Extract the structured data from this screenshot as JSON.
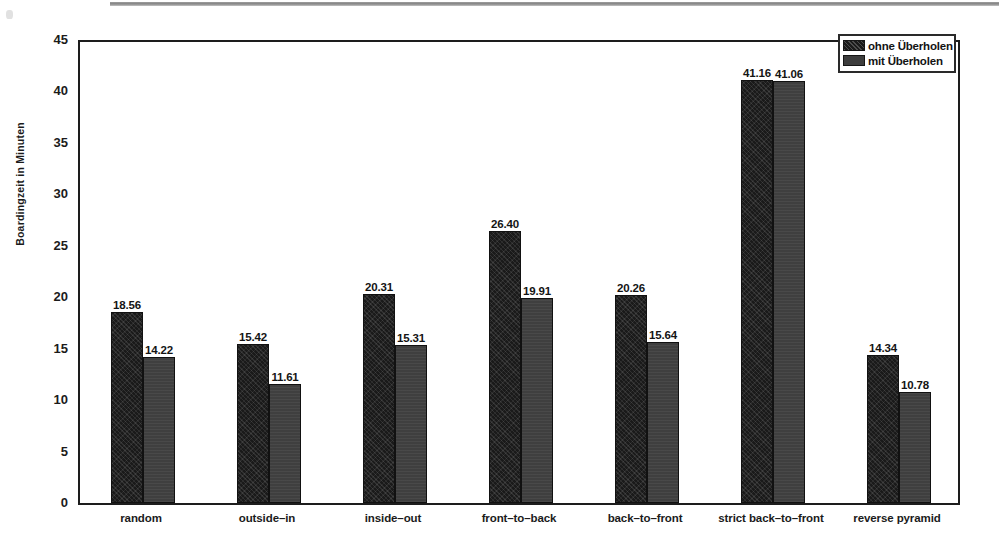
{
  "chart_data": {
    "type": "bar",
    "title": "",
    "xlabel": "",
    "ylabel": "Boardingzeit in Minuten",
    "ylim": [
      0,
      45
    ],
    "ytick_labels": [
      "0",
      "5",
      "10",
      "15",
      "20",
      "25",
      "30",
      "35",
      "40",
      "45"
    ],
    "ytick_values": [
      0,
      5,
      10,
      15,
      20,
      25,
      30,
      35,
      40,
      45
    ],
    "grid": false,
    "legend_position": "top-right",
    "categories": [
      "random",
      "outside–in",
      "inside–out",
      "front–to–back",
      "back–to–front",
      "strict back–to–front",
      "reverse pyramid"
    ],
    "series": [
      {
        "name": "ohne Überholen",
        "color": "#1a1a1a",
        "values": [
          18.56,
          15.42,
          20.31,
          26.4,
          20.26,
          41.16,
          14.34
        ],
        "labels": [
          "18.56",
          "15.42",
          "20.31",
          "26.40",
          "20.26",
          "41.16",
          "14.34"
        ]
      },
      {
        "name": "mit Überholen",
        "color": "#3f3f3f",
        "values": [
          14.22,
          11.61,
          15.31,
          19.91,
          15.64,
          41.06,
          10.78
        ],
        "labels": [
          "14.22",
          "11.61",
          "15.31",
          "19.91",
          "15.64",
          "41.06",
          "10.78"
        ]
      }
    ]
  },
  "legend": {
    "entries": [
      {
        "label": "ohne Überholen"
      },
      {
        "label": "mit Überholen"
      }
    ]
  },
  "axes": {
    "y_label": "Boardingzeit in Minuten"
  }
}
